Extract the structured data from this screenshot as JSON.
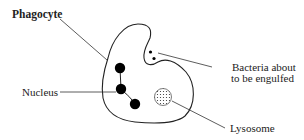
{
  "diagram": {
    "title": "Phagocyte",
    "labels": {
      "phagocyte": "Phagocyte",
      "bacteria_line1": "Bacteria about",
      "bacteria_line2": "to be engulfed",
      "nucleus": "Nucleus",
      "lysosome": "Lysosome"
    },
    "colors": {
      "outline": "#222222",
      "fill": "#ffffff",
      "nucleus": "#000000",
      "text": "#222222"
    }
  }
}
